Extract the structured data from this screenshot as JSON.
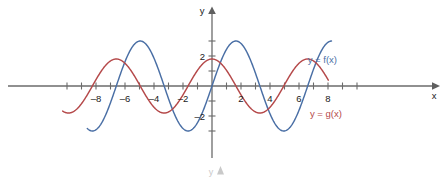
{
  "chart_data": {
    "type": "line",
    "title": "",
    "subtitle": "",
    "xlabel": "x",
    "ylabel": "y",
    "xlim": [
      -10.4,
      10.4
    ],
    "ylim": [
      -3.9,
      3.9
    ],
    "grid": false,
    "legend_position": "inline-right",
    "x_ticks": [
      -10,
      -9,
      -8,
      -7,
      -6,
      -5,
      -4,
      -3,
      -2,
      -1,
      1,
      2,
      3,
      4,
      5,
      6,
      7,
      8,
      9,
      10
    ],
    "x_tick_labels": [
      {
        "value": -8,
        "text": "–8"
      },
      {
        "value": -6,
        "text": "–6"
      },
      {
        "value": -4,
        "text": "–4"
      },
      {
        "value": -2,
        "text": "–2"
      },
      {
        "value": 2,
        "text": "2"
      },
      {
        "value": 4,
        "text": "4"
      },
      {
        "value": 6,
        "text": "6"
      },
      {
        "value": 8,
        "text": "8"
      }
    ],
    "y_ticks": [
      -3,
      -2,
      -1,
      1,
      2,
      3
    ],
    "y_tick_labels": [
      {
        "value": 2,
        "text": "2"
      },
      {
        "value": -2,
        "text": "–2"
      }
    ],
    "series": [
      {
        "name": "y = f(x)",
        "color": "#4a6fa5",
        "amplitude": 3.0,
        "period": 6.6,
        "phase": 0.0,
        "x_start": -8.6,
        "x_end": 8.25,
        "zeros": [
          -6.6,
          -3.3,
          0,
          3.3,
          6.6
        ],
        "maxima": [
          {
            "x": -4.95,
            "y": 3.0
          },
          {
            "x": 1.65,
            "y": 3.0
          },
          {
            "x": 8.25,
            "y": 3.0
          }
        ],
        "minima": [
          {
            "x": -8.25,
            "y": -3.0
          },
          {
            "x": -1.65,
            "y": -3.0
          },
          {
            "x": 4.95,
            "y": -3.0
          }
        ]
      },
      {
        "name": "y = g(x)",
        "color": "#b5494a",
        "amplitude": 1.8,
        "period": 6.6,
        "phase": 4.95,
        "x_start": -10.3,
        "x_end": 8.05,
        "zeros": [
          -9.9,
          -6.6,
          -3.3,
          0,
          3.3,
          6.6
        ],
        "maxima": [
          {
            "x": -8.25,
            "y": 1.8
          },
          {
            "x": -1.65,
            "y": 1.8
          },
          {
            "x": 4.95,
            "y": 1.8
          }
        ],
        "minima": [
          {
            "x": -4.95,
            "y": -1.8
          },
          {
            "x": 1.65,
            "y": -1.8
          }
        ]
      }
    ],
    "annotations": [
      {
        "name": "f-label",
        "text": "y = f(x)",
        "x": 6.6,
        "y": 1.55,
        "color": "#4a6fa5"
      },
      {
        "name": "g-label",
        "text": "y = g(x)",
        "x": 6.75,
        "y": -2.05,
        "color": "#b5494a"
      }
    ]
  },
  "axes": {
    "x_axis_name": "x",
    "y_axis_name": "y"
  },
  "artifact": {
    "ghost_y_label": "y"
  },
  "colors": {
    "f_curve": "#4a6fa5",
    "g_curve": "#b5494a",
    "axis": "#6b6b6b",
    "text": "#1a1a1a",
    "background": "#ffffff"
  }
}
